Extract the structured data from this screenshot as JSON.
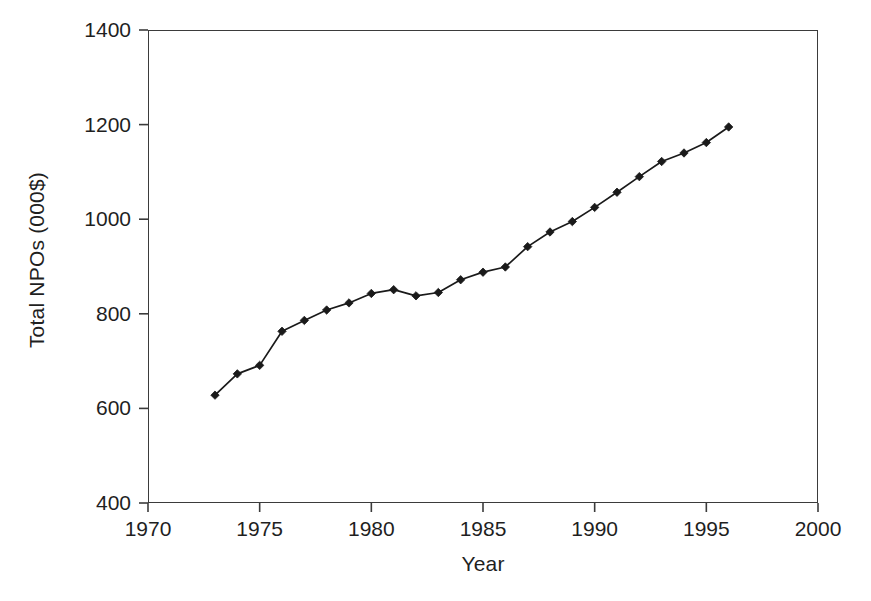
{
  "chart_data": {
    "type": "line",
    "title": "",
    "xlabel": "Year",
    "ylabel": "Total NPOs (000$)",
    "xlim": [
      1970,
      2000
    ],
    "ylim": [
      400,
      1400
    ],
    "xticks": [
      1970,
      1975,
      1980,
      1985,
      1990,
      1995,
      2000
    ],
    "yticks": [
      400,
      600,
      800,
      1000,
      1200,
      1400
    ],
    "xtick_labels": [
      "1970",
      "1975",
      "1980",
      "1985",
      "1990",
      "1995",
      "2000"
    ],
    "ytick_labels": [
      "400",
      "600",
      "800",
      "1000",
      "1200",
      "1400"
    ],
    "grid": false,
    "legend": null,
    "marker": "diamond",
    "line_color": "#1a1a1a",
    "marker_color": "#1a1a1a",
    "x": [
      1973,
      1974,
      1975,
      1976,
      1977,
      1978,
      1979,
      1980,
      1981,
      1982,
      1983,
      1984,
      1985,
      1986,
      1987,
      1988,
      1989,
      1990,
      1991,
      1992,
      1993,
      1994,
      1995,
      1996
    ],
    "values": [
      628,
      673,
      691,
      763,
      786,
      808,
      823,
      843,
      851,
      838,
      845,
      872,
      888,
      899,
      942,
      973,
      995,
      1025,
      1057,
      1090,
      1122,
      1140,
      1162,
      1195
    ]
  },
  "axes": {
    "frame_color": "#3b3b3b",
    "background": "#ffffff"
  }
}
